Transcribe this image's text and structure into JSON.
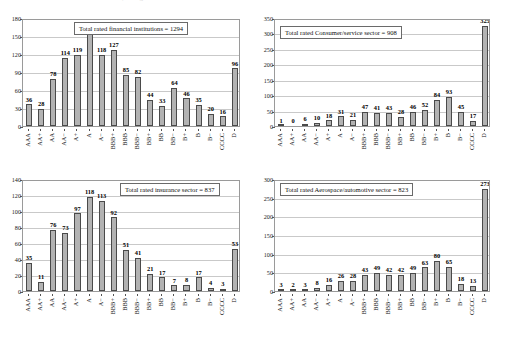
{
  "page": {
    "top_caption": "Source: Standard & Poor's CreditPro®; ratings as of Dec. 31"
  },
  "ratings": [
    "AAA",
    "AA+",
    "AA",
    "AA−",
    "A+",
    "A",
    "A−",
    "BBB+",
    "BBB",
    "BBB−",
    "BB+",
    "BB",
    "BB−",
    "B+",
    "B",
    "B−",
    "CCCC",
    "D"
  ],
  "style": {
    "bar_fill": "#b3b3b3",
    "bar_stroke": "#4a4a4a",
    "gridline": "#c9c9c9",
    "axis": "#555555"
  },
  "charts": [
    {
      "id": "financial-institutions",
      "type": "bar",
      "title": "Total rated financial institutions = 1294",
      "total": 1294,
      "xlabel": "",
      "ylabel": "",
      "ylim": [
        0,
        180
      ],
      "yticks": [
        0,
        30,
        60,
        90,
        120,
        150,
        180
      ],
      "grid": true,
      "categories": [
        "AAA",
        "AA+",
        "AA",
        "AA−",
        "A+",
        "A",
        "A−",
        "BBB+",
        "BBB",
        "BBB−",
        "BB+",
        "BB",
        "BB−",
        "B+",
        "B",
        "B−",
        "CCCC",
        "D"
      ],
      "values": [
        36,
        28,
        78,
        114,
        119,
        153,
        118,
        127,
        85,
        82,
        44,
        33,
        64,
        46,
        35,
        20,
        16,
        96
      ]
    },
    {
      "id": "consumer-service",
      "type": "bar",
      "title": "Total rated Consumer/service sector = 908",
      "total": 908,
      "xlabel": "",
      "ylabel": "",
      "ylim": [
        0,
        350
      ],
      "yticks": [
        0,
        50,
        100,
        150,
        200,
        250,
        300,
        350
      ],
      "grid": true,
      "categories": [
        "AAA",
        "AA+",
        "AA",
        "AA−",
        "A+",
        "A",
        "A−",
        "BBB+",
        "BBB",
        "BBB−",
        "BB+",
        "BB",
        "BB−",
        "B+",
        "B",
        "B−",
        "CCCC",
        "D"
      ],
      "values": [
        1,
        0,
        6,
        10,
        18,
        31,
        21,
        47,
        41,
        43,
        28,
        46,
        52,
        84,
        93,
        45,
        17,
        325
      ]
    },
    {
      "id": "insurance",
      "type": "bar",
      "title": "Total rated insurance sector = 837",
      "total": 837,
      "xlabel": "",
      "ylabel": "",
      "ylim": [
        0,
        140
      ],
      "yticks": [
        0,
        20,
        40,
        60,
        80,
        100,
        120,
        140
      ],
      "grid": true,
      "categories": [
        "AAA",
        "AA+",
        "AA",
        "AA−",
        "A+",
        "A",
        "A−",
        "BBB+",
        "BBB",
        "BBB−",
        "BB+",
        "BB",
        "BB−",
        "B+",
        "B",
        "B−",
        "CCCC",
        "D"
      ],
      "values": [
        35,
        11,
        76,
        73,
        97,
        118,
        113,
        92,
        51,
        41,
        21,
        17,
        7,
        8,
        17,
        4,
        3,
        53
      ]
    },
    {
      "id": "aerospace-automotive",
      "type": "bar",
      "title": "Total rated Aerospace/automotive sector = 823",
      "total": 823,
      "xlabel": "",
      "ylabel": "",
      "ylim": [
        0,
        300
      ],
      "yticks": [
        0,
        50,
        100,
        150,
        200,
        250,
        300
      ],
      "grid": true,
      "categories": [
        "AAA",
        "AA+",
        "AA",
        "AA−",
        "A+",
        "A",
        "A−",
        "BBB+",
        "BBB",
        "BBB−",
        "BB+",
        "BB",
        "BB−",
        "B+",
        "B",
        "B−",
        "CCCC",
        "D"
      ],
      "values": [
        3,
        2,
        3,
        8,
        16,
        26,
        28,
        43,
        49,
        42,
        42,
        49,
        63,
        80,
        65,
        18,
        13,
        273
      ]
    }
  ],
  "chart_data": [
    {
      "type": "bar",
      "title": "Total rated financial institutions = 1294",
      "categories": [
        "AAA",
        "AA+",
        "AA",
        "AA-",
        "A+",
        "A",
        "A-",
        "BBB+",
        "BBB",
        "BBB-",
        "BB+",
        "BB",
        "BB-",
        "B+",
        "B",
        "B-",
        "CCCC",
        "D"
      ],
      "values": [
        36,
        28,
        78,
        114,
        119,
        153,
        118,
        127,
        85,
        82,
        44,
        33,
        64,
        46,
        35,
        20,
        16,
        96
      ],
      "xlabel": "",
      "ylabel": "",
      "ylim": [
        0,
        180
      ],
      "yticks": [
        0,
        30,
        60,
        90,
        120,
        150,
        180
      ],
      "grid": true,
      "legend": "none"
    },
    {
      "type": "bar",
      "title": "Total rated Consumer/service sector = 908",
      "categories": [
        "AAA",
        "AA+",
        "AA",
        "AA-",
        "A+",
        "A",
        "A-",
        "BBB+",
        "BBB",
        "BBB-",
        "BB+",
        "BB",
        "BB-",
        "B+",
        "B",
        "B-",
        "CCCC",
        "D"
      ],
      "values": [
        1,
        0,
        6,
        10,
        18,
        31,
        21,
        47,
        41,
        43,
        28,
        46,
        52,
        84,
        93,
        45,
        17,
        325
      ],
      "xlabel": "",
      "ylabel": "",
      "ylim": [
        0,
        350
      ],
      "yticks": [
        0,
        50,
        100,
        150,
        200,
        250,
        300,
        350
      ],
      "grid": true,
      "legend": "none"
    },
    {
      "type": "bar",
      "title": "Total rated insurance sector = 837",
      "categories": [
        "AAA",
        "AA+",
        "AA",
        "AA-",
        "A+",
        "A",
        "A-",
        "BBB+",
        "BBB",
        "BBB-",
        "BB+",
        "BB",
        "BB-",
        "B+",
        "B",
        "B-",
        "CCCC",
        "D"
      ],
      "values": [
        35,
        11,
        76,
        73,
        97,
        118,
        113,
        92,
        51,
        41,
        21,
        17,
        7,
        8,
        17,
        4,
        3,
        53
      ],
      "xlabel": "",
      "ylabel": "",
      "ylim": [
        0,
        140
      ],
      "yticks": [
        0,
        20,
        40,
        60,
        80,
        100,
        120,
        140
      ],
      "grid": true,
      "legend": "none"
    },
    {
      "type": "bar",
      "title": "Total rated Aerospace/automotive sector = 823",
      "categories": [
        "AAA",
        "AA+",
        "AA",
        "AA-",
        "A+",
        "A",
        "A-",
        "BBB+",
        "BBB",
        "BBB-",
        "BB+",
        "BB",
        "BB-",
        "B+",
        "B",
        "B-",
        "CCCC",
        "D"
      ],
      "values": [
        3,
        2,
        3,
        8,
        16,
        26,
        28,
        43,
        49,
        42,
        42,
        49,
        63,
        80,
        65,
        18,
        13,
        273
      ],
      "xlabel": "",
      "ylabel": "",
      "ylim": [
        0,
        300
      ],
      "yticks": [
        0,
        50,
        100,
        150,
        200,
        250,
        300
      ],
      "grid": true,
      "legend": "none"
    }
  ]
}
